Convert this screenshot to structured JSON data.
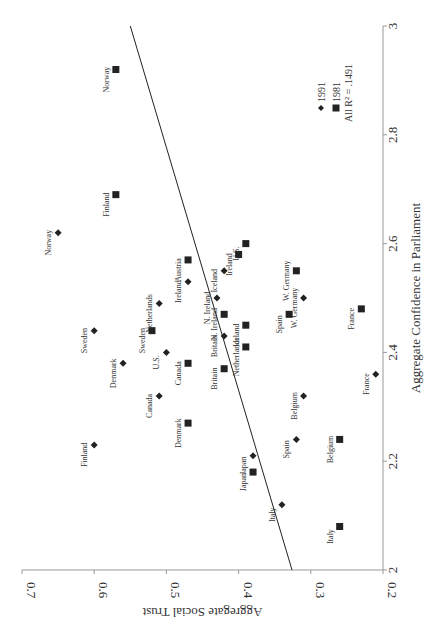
{
  "chart_data": {
    "type": "scatter",
    "orientation_note": "figure printed rotated 90 degrees clockwise",
    "title": "",
    "xlabel": "Aggregate Confidence in Parliament",
    "ylabel": "Aggregate Social Trust",
    "xlim": [
      2,
      3
    ],
    "ylim": [
      0.2,
      0.7
    ],
    "x_ticks": [
      "2",
      "2.2",
      "2.4",
      "2.6",
      "2.8",
      "3"
    ],
    "y_ticks": [
      "0.2",
      "0.3",
      "0.4",
      "0.5",
      "0.6",
      "0.7"
    ],
    "grid": false,
    "legend": {
      "entries": [
        {
          "label": "1991",
          "marker": "diamond"
        },
        {
          "label": "1981",
          "marker": "square"
        }
      ],
      "annotation": "All R² = .1491"
    },
    "fit_line": {
      "x": [
        2,
        3
      ],
      "y": [
        0.326,
        0.55
      ]
    },
    "series": [
      {
        "name": "1991",
        "marker": "diamond",
        "points": [
          {
            "label": "Norway",
            "x": 2.62,
            "y": 0.65
          },
          {
            "label": "Ireland",
            "x": 2.53,
            "y": 0.47
          },
          {
            "label": "Netherlands",
            "x": 2.49,
            "y": 0.51
          },
          {
            "label": "Iceland",
            "x": 2.55,
            "y": 0.42
          },
          {
            "label": "W. Germany",
            "x": 2.5,
            "y": 0.31
          },
          {
            "label": "N. Ireland",
            "x": 2.5,
            "y": 0.43
          },
          {
            "label": "Britain",
            "x": 2.43,
            "y": 0.42
          },
          {
            "label": "Sweden",
            "x": 2.44,
            "y": 0.6
          },
          {
            "label": "U.S.",
            "x": 2.4,
            "y": 0.5
          },
          {
            "label": "Denmark",
            "x": 2.38,
            "y": 0.56
          },
          {
            "label": "Canada",
            "x": 2.32,
            "y": 0.51
          },
          {
            "label": "Belgium",
            "x": 2.32,
            "y": 0.31
          },
          {
            "label": "France",
            "x": 2.36,
            "y": 0.21
          },
          {
            "label": "Finland",
            "x": 2.23,
            "y": 0.6
          },
          {
            "label": "Spain",
            "x": 2.24,
            "y": 0.32
          },
          {
            "label": "Japan",
            "x": 2.21,
            "y": 0.38
          },
          {
            "label": "Italy",
            "x": 2.12,
            "y": 0.34
          }
        ]
      },
      {
        "name": "1981",
        "marker": "square",
        "points": [
          {
            "label": "Norway",
            "x": 2.92,
            "y": 0.57
          },
          {
            "label": "Finland",
            "x": 2.69,
            "y": 0.57
          },
          {
            "label": "Austria",
            "x": 2.57,
            "y": 0.47
          },
          {
            "label": "Ireland",
            "x": 2.58,
            "y": 0.4
          },
          {
            "label": "U.S.",
            "x": 2.6,
            "y": 0.39
          },
          {
            "label": "W. Germany",
            "x": 2.55,
            "y": 0.32
          },
          {
            "label": "N. Ireland",
            "x": 2.47,
            "y": 0.42
          },
          {
            "label": "Spain",
            "x": 2.47,
            "y": 0.33
          },
          {
            "label": "Iceland",
            "x": 2.45,
            "y": 0.39
          },
          {
            "label": "Netherlands",
            "x": 2.41,
            "y": 0.39
          },
          {
            "label": "France",
            "x": 2.48,
            "y": 0.23
          },
          {
            "label": "Sweden",
            "x": 2.44,
            "y": 0.52
          },
          {
            "label": "Canada",
            "x": 2.38,
            "y": 0.47
          },
          {
            "label": "Britain",
            "x": 2.37,
            "y": 0.42
          },
          {
            "label": "Denmark",
            "x": 2.27,
            "y": 0.47
          },
          {
            "label": "Belgium",
            "x": 2.24,
            "y": 0.26
          },
          {
            "label": "Japan",
            "x": 2.18,
            "y": 0.38
          },
          {
            "label": "Italy",
            "x": 2.08,
            "y": 0.26
          }
        ]
      }
    ]
  }
}
